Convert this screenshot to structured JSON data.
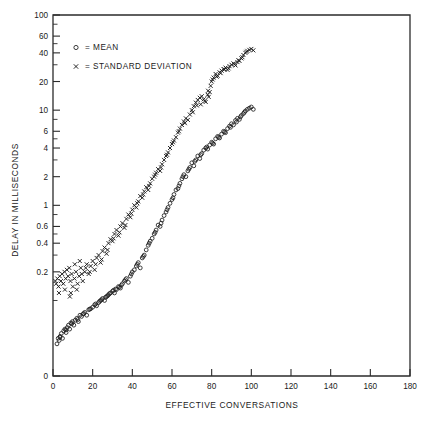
{
  "chart_data": {
    "type": "scatter",
    "title": "",
    "xlabel": "EFFECTIVE CONVERSATIONS",
    "ylabel": "DELAY IN MILLISECONDS",
    "xscale": "linear",
    "yscale": "log",
    "xlim": [
      0,
      180
    ],
    "ylim": [
      0.02,
      100
    ],
    "grid": false,
    "legend_position": "top-left",
    "xticks": [
      0,
      20,
      40,
      60,
      80,
      100,
      120,
      140,
      160,
      180
    ],
    "xtick_labels": [
      "0",
      "20",
      "40",
      "60",
      "80",
      "100",
      "120",
      "140",
      "160",
      "180"
    ],
    "yticks": [
      0,
      0.2,
      0.4,
      0.6,
      1,
      2,
      4,
      6,
      10,
      20,
      40,
      60,
      100
    ],
    "ytick_labels": [
      "0",
      "0.2",
      "0.4",
      "0.6",
      "1",
      "2",
      "4",
      "6",
      "10",
      "20",
      "40",
      "60",
      "100"
    ],
    "y_minor_ticks": [
      0.1,
      0.3,
      0.5,
      0.8,
      3,
      5,
      8,
      30,
      50,
      80
    ],
    "legend": [
      {
        "marker": "o",
        "symbol": "○",
        "label": "= MEAN"
      },
      {
        "marker": "x",
        "symbol": "×",
        "label": "= STANDARD DEVIATION"
      }
    ],
    "series": [
      {
        "name": "MEAN",
        "marker": "circle",
        "color": "#1d1d1d",
        "points": [
          [
            2.0,
            0.035
          ],
          [
            2.6,
            0.04
          ],
          [
            3.1,
            0.038
          ],
          [
            3.6,
            0.042
          ],
          [
            4.2,
            0.045
          ],
          [
            4.8,
            0.04
          ],
          [
            5.4,
            0.048
          ],
          [
            6.0,
            0.05
          ],
          [
            6.6,
            0.046
          ],
          [
            7.2,
            0.052
          ],
          [
            7.8,
            0.055
          ],
          [
            8.4,
            0.05
          ],
          [
            9.0,
            0.058
          ],
          [
            9.8,
            0.06
          ],
          [
            10.5,
            0.055
          ],
          [
            11.2,
            0.062
          ],
          [
            12.0,
            0.065
          ],
          [
            12.8,
            0.06
          ],
          [
            13.6,
            0.07
          ],
          [
            14.4,
            0.068
          ],
          [
            15.2,
            0.072
          ],
          [
            16.0,
            0.075
          ],
          [
            17.0,
            0.07
          ],
          [
            18.0,
            0.08
          ],
          [
            19.0,
            0.082
          ],
          [
            20.0,
            0.085
          ],
          [
            21.0,
            0.09
          ],
          [
            22.0,
            0.088
          ],
          [
            23.0,
            0.095
          ],
          [
            24.0,
            0.1
          ],
          [
            25.0,
            0.105
          ],
          [
            26.0,
            0.1
          ],
          [
            27.0,
            0.11
          ],
          [
            28.0,
            0.115
          ],
          [
            29.0,
            0.12
          ],
          [
            30.0,
            0.125
          ],
          [
            31.0,
            0.12
          ],
          [
            32.0,
            0.13
          ],
          [
            33.0,
            0.14
          ],
          [
            34.0,
            0.135
          ],
          [
            35.0,
            0.15
          ],
          [
            36.0,
            0.16
          ],
          [
            37.0,
            0.17
          ],
          [
            38.0,
            0.155
          ],
          [
            39.0,
            0.18
          ],
          [
            40.0,
            0.2
          ],
          [
            41.0,
            0.21
          ],
          [
            42.0,
            0.23
          ],
          [
            43.0,
            0.25
          ],
          [
            44.0,
            0.22
          ],
          [
            45.0,
            0.28
          ],
          [
            46.0,
            0.3
          ],
          [
            47.0,
            0.34
          ],
          [
            48.0,
            0.38
          ],
          [
            49.0,
            0.42
          ],
          [
            50.0,
            0.45
          ],
          [
            51.0,
            0.5
          ],
          [
            52.0,
            0.55
          ],
          [
            53.0,
            0.62
          ],
          [
            54.0,
            0.6
          ],
          [
            55.0,
            0.7
          ],
          [
            56.0,
            0.78
          ],
          [
            57.0,
            0.85
          ],
          [
            58.0,
            0.95
          ],
          [
            59.0,
            1.05
          ],
          [
            60.0,
            1.15
          ],
          [
            61.0,
            1.3
          ],
          [
            62.0,
            1.45
          ],
          [
            63.0,
            1.5
          ],
          [
            64.0,
            1.7
          ],
          [
            65.0,
            1.9
          ],
          [
            66.0,
            2.1
          ],
          [
            67.0,
            2.0
          ],
          [
            68.0,
            2.3
          ],
          [
            69.0,
            2.5
          ],
          [
            70.0,
            2.8
          ],
          [
            71.0,
            2.6
          ],
          [
            72.0,
            3.0
          ],
          [
            73.0,
            3.3
          ],
          [
            74.0,
            3.1
          ],
          [
            75.0,
            3.5
          ],
          [
            76.0,
            3.8
          ],
          [
            77.0,
            4.0
          ],
          [
            78.0,
            3.9
          ],
          [
            79.0,
            4.3
          ],
          [
            80.0,
            4.6
          ],
          [
            81.0,
            4.4
          ],
          [
            82.0,
            5.0
          ],
          [
            83.0,
            5.3
          ],
          [
            84.0,
            5.1
          ],
          [
            85.0,
            5.6
          ],
          [
            86.0,
            6.0
          ],
          [
            87.0,
            5.8
          ],
          [
            88.0,
            6.4
          ],
          [
            89.0,
            6.8
          ],
          [
            90.0,
            7.2
          ],
          [
            91.0,
            7.0
          ],
          [
            92.0,
            7.8
          ],
          [
            93.0,
            8.2
          ],
          [
            94.0,
            8.0
          ],
          [
            95.0,
            8.8
          ],
          [
            96.0,
            9.2
          ],
          [
            97.0,
            9.8
          ],
          [
            98.0,
            10.2
          ],
          [
            99.0,
            10.5
          ],
          [
            100.0,
            10.8
          ],
          [
            101.0,
            10.2
          ],
          [
            96.5,
            9.5
          ],
          [
            94.5,
            8.5
          ],
          [
            92.5,
            7.5
          ],
          [
            89.5,
            6.6
          ],
          [
            86.5,
            5.9
          ],
          [
            83.5,
            5.2
          ],
          [
            80.5,
            4.5
          ],
          [
            77.5,
            4.1
          ],
          [
            74.5,
            3.4
          ],
          [
            71.5,
            2.9
          ],
          [
            68.5,
            2.4
          ],
          [
            65.5,
            2.0
          ],
          [
            63.5,
            1.6
          ],
          [
            60.5,
            1.2
          ],
          [
            57.5,
            0.9
          ],
          [
            54.5,
            0.65
          ],
          [
            51.5,
            0.52
          ],
          [
            48.5,
            0.4
          ],
          [
            45.5,
            0.29
          ],
          [
            42.5,
            0.24
          ],
          [
            39.5,
            0.19
          ],
          [
            36.5,
            0.165
          ],
          [
            33.5,
            0.138
          ],
          [
            30.5,
            0.128
          ],
          [
            27.5,
            0.112
          ],
          [
            24.5,
            0.102
          ],
          [
            21.5,
            0.092
          ],
          [
            18.5,
            0.081
          ],
          [
            15.5,
            0.073
          ],
          [
            12.5,
            0.063
          ],
          [
            9.5,
            0.057
          ],
          [
            6.5,
            0.049
          ],
          [
            3.5,
            0.041
          ],
          [
            28.5,
            0.118
          ],
          [
            31.5,
            0.132
          ],
          [
            34.5,
            0.145
          ],
          [
            26.5,
            0.108
          ],
          [
            23.5,
            0.098
          ]
        ]
      },
      {
        "name": "STANDARD DEVIATION",
        "marker": "x",
        "color": "#1d1d1d",
        "points": [
          [
            1.6,
            0.15
          ],
          [
            2.2,
            0.17
          ],
          [
            2.8,
            0.14
          ],
          [
            3.4,
            0.18
          ],
          [
            4.0,
            0.16
          ],
          [
            4.6,
            0.19
          ],
          [
            5.2,
            0.15
          ],
          [
            5.8,
            0.2
          ],
          [
            6.4,
            0.17
          ],
          [
            7.0,
            0.21
          ],
          [
            7.6,
            0.18
          ],
          [
            8.2,
            0.22
          ],
          [
            8.8,
            0.16
          ],
          [
            9.4,
            0.19
          ],
          [
            10.0,
            0.14
          ],
          [
            10.8,
            0.17
          ],
          [
            11.6,
            0.2
          ],
          [
            12.4,
            0.15
          ],
          [
            13.2,
            0.18
          ],
          [
            14.0,
            0.22
          ],
          [
            15.0,
            0.16
          ],
          [
            16.0,
            0.2
          ],
          [
            17.0,
            0.24
          ],
          [
            18.0,
            0.19
          ],
          [
            19.0,
            0.23
          ],
          [
            20.0,
            0.26
          ],
          [
            21.0,
            0.21
          ],
          [
            22.0,
            0.28
          ],
          [
            23.0,
            0.3
          ],
          [
            24.0,
            0.25
          ],
          [
            25.0,
            0.33
          ],
          [
            26.0,
            0.36
          ],
          [
            27.0,
            0.31
          ],
          [
            28.0,
            0.4
          ],
          [
            29.0,
            0.44
          ],
          [
            30.0,
            0.42
          ],
          [
            31.0,
            0.5
          ],
          [
            32.0,
            0.55
          ],
          [
            33.0,
            0.48
          ],
          [
            34.0,
            0.6
          ],
          [
            35.0,
            0.65
          ],
          [
            36.0,
            0.58
          ],
          [
            37.0,
            0.72
          ],
          [
            38.0,
            0.8
          ],
          [
            39.0,
            0.75
          ],
          [
            40.0,
            0.9
          ],
          [
            41.0,
            1.0
          ],
          [
            42.0,
            0.95
          ],
          [
            43.0,
            1.1
          ],
          [
            44.0,
            1.25
          ],
          [
            45.0,
            1.2
          ],
          [
            46.0,
            1.4
          ],
          [
            47.0,
            1.55
          ],
          [
            48.0,
            1.45
          ],
          [
            49.0,
            1.7
          ],
          [
            50.0,
            1.9
          ],
          [
            51.0,
            2.0
          ],
          [
            52.0,
            2.2
          ],
          [
            53.0,
            2.4
          ],
          [
            54.0,
            2.3
          ],
          [
            55.0,
            2.7
          ],
          [
            56.0,
            3.0
          ],
          [
            57.0,
            3.3
          ],
          [
            58.0,
            3.6
          ],
          [
            59.0,
            4.0
          ],
          [
            60.0,
            4.4
          ],
          [
            61.0,
            4.8
          ],
          [
            62.0,
            5.2
          ],
          [
            63.0,
            5.8
          ],
          [
            64.0,
            6.4
          ],
          [
            65.0,
            7.0
          ],
          [
            66.0,
            7.6
          ],
          [
            67.0,
            8.2
          ],
          [
            68.0,
            7.9
          ],
          [
            69.0,
            9.0
          ],
          [
            70.0,
            10.0
          ],
          [
            71.0,
            11.0
          ],
          [
            72.0,
            12.0
          ],
          [
            73.0,
            12.8
          ],
          [
            74.0,
            13.5
          ],
          [
            75.0,
            14.0
          ],
          [
            76.0,
            13.0
          ],
          [
            77.0,
            12.2
          ],
          [
            78.0,
            14.5
          ],
          [
            79.0,
            15.5
          ],
          [
            74.5,
            11.5
          ],
          [
            76.5,
            12.5
          ],
          [
            78.5,
            13.8
          ],
          [
            72.5,
            11.2
          ],
          [
            70.5,
            9.5
          ],
          [
            80.0,
            20.0
          ],
          [
            81.0,
            22.0
          ],
          [
            82.0,
            24.0
          ],
          [
            83.0,
            23.0
          ],
          [
            84.0,
            25.0
          ],
          [
            85.0,
            26.0
          ],
          [
            86.0,
            27.0
          ],
          [
            87.0,
            28.0
          ],
          [
            88.0,
            26.5
          ],
          [
            89.0,
            29.0
          ],
          [
            90.0,
            30.0
          ],
          [
            91.0,
            31.0
          ],
          [
            92.0,
            29.5
          ],
          [
            93.0,
            32.0
          ],
          [
            94.0,
            33.0
          ],
          [
            95.0,
            35.0
          ],
          [
            96.0,
            38.0
          ],
          [
            97.0,
            40.0
          ],
          [
            98.0,
            42.0
          ],
          [
            99.0,
            43.0
          ],
          [
            100.0,
            44.0
          ],
          [
            101.0,
            42.5
          ],
          [
            97.5,
            41.0
          ],
          [
            95.5,
            36.0
          ],
          [
            93.5,
            33.5
          ],
          [
            91.5,
            30.5
          ],
          [
            88.5,
            27.5
          ],
          [
            86.5,
            26.8
          ],
          [
            84.5,
            24.5
          ],
          [
            82.5,
            22.5
          ],
          [
            80.5,
            21.0
          ],
          [
            79.5,
            18.0
          ],
          [
            78.2,
            16.0
          ],
          [
            66.5,
            7.3
          ],
          [
            63.5,
            6.0
          ],
          [
            60.5,
            4.6
          ],
          [
            57.5,
            3.4
          ],
          [
            54.5,
            2.5
          ],
          [
            51.5,
            2.1
          ],
          [
            48.5,
            1.6
          ],
          [
            45.5,
            1.3
          ],
          [
            42.5,
            1.05
          ],
          [
            39.5,
            0.82
          ],
          [
            36.5,
            0.62
          ],
          [
            33.5,
            0.52
          ],
          [
            30.5,
            0.45
          ],
          [
            27.5,
            0.34
          ],
          [
            24.5,
            0.27
          ],
          [
            21.5,
            0.24
          ],
          [
            18.5,
            0.2
          ],
          [
            12.0,
            0.13
          ],
          [
            9.0,
            0.12
          ],
          [
            6.0,
            0.13
          ],
          [
            3.0,
            0.12
          ],
          [
            1.2,
            0.16
          ],
          [
            13.5,
            0.26
          ],
          [
            16.5,
            0.22
          ],
          [
            11.0,
            0.24
          ],
          [
            14.5,
            0.19
          ],
          [
            8.5,
            0.11
          ]
        ]
      }
    ]
  }
}
